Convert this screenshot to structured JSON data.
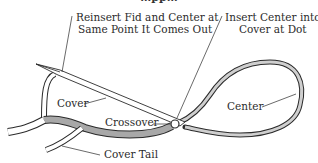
{
  "diagram": {
    "clipped_title": "…pp…",
    "labels": {
      "reinsert": [
        "Reinsert Fid and Center at",
        "Same Point It Comes Out"
      ],
      "insert": [
        "Insert Center into",
        "Cover at Dot"
      ],
      "cover": "Cover",
      "crossover": "Crossover",
      "center": "Center",
      "cover_tail": "Cover Tail"
    },
    "colors": {
      "line": "#2a2a2a",
      "rope_fill": "#ffffff",
      "shaded_rope": "#a8a8a8",
      "center_rope": "#c8c8c8"
    }
  }
}
